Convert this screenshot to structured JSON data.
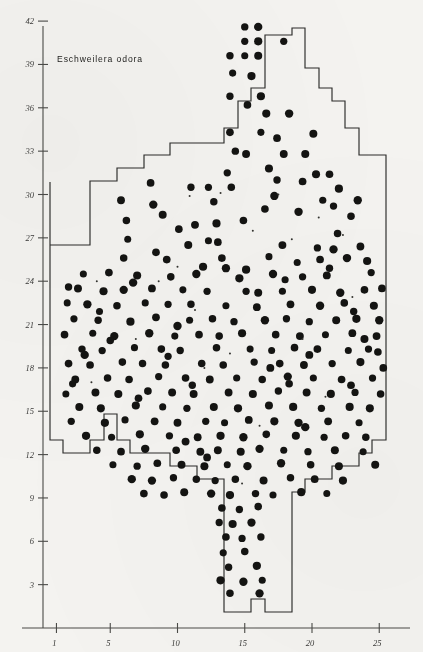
{
  "figure": {
    "title": "Eschweilera odora",
    "background_color": "#f4f3f0",
    "ink_color": "#141412",
    "axis_color": "#4a4a47"
  },
  "chart_data": {
    "type": "scatter",
    "title": "Eschweilera odora",
    "xlabel": "",
    "ylabel": "",
    "xlim": [
      0,
      26.5
    ],
    "ylim": [
      0,
      43
    ],
    "grid": false,
    "legend": null,
    "x_ticks": [
      1,
      5,
      10,
      15,
      20,
      25
    ],
    "x_tick_labels": [
      "1",
      "5",
      "10",
      "15",
      "20",
      "25"
    ],
    "y_ticks": [
      3,
      6,
      9,
      12,
      15,
      18,
      21,
      24,
      27,
      30,
      33,
      36,
      39,
      42
    ],
    "y_tick_labels": [
      "3",
      "6",
      "9",
      "12",
      "15",
      "18",
      "21",
      "24",
      "27",
      "30",
      "33",
      "36",
      "39",
      "42"
    ],
    "marker": "filled-circle",
    "marker_color": "#141412",
    "boundary_note": "irregular stepped plot outline",
    "point_count": 312,
    "points": [
      [
        15.0,
        41.6
      ],
      [
        16.0,
        41.6
      ],
      [
        15.0,
        40.6
      ],
      [
        16.0,
        40.6
      ],
      [
        17.9,
        40.6
      ],
      [
        13.9,
        39.6
      ],
      [
        15.0,
        39.6
      ],
      [
        16.0,
        39.6
      ],
      [
        15.5,
        38.2
      ],
      [
        13.9,
        36.8
      ],
      [
        16.2,
        36.8
      ],
      [
        16.6,
        35.6
      ],
      [
        18.3,
        35.6
      ],
      [
        13.9,
        34.3
      ],
      [
        16.2,
        34.3
      ],
      [
        15.1,
        32.8
      ],
      [
        17.9,
        32.8
      ],
      [
        19.5,
        32.8
      ],
      [
        13.7,
        31.5
      ],
      [
        17.4,
        31.0
      ],
      [
        20.3,
        31.4
      ],
      [
        21.3,
        31.4
      ],
      [
        8.0,
        30.8
      ],
      [
        11.0,
        30.5
      ],
      [
        12.3,
        30.5
      ],
      [
        14.0,
        30.5
      ],
      [
        19.3,
        30.9
      ],
      [
        22.0,
        30.4
      ],
      [
        5.8,
        29.6
      ],
      [
        8.2,
        29.3
      ],
      [
        21.6,
        29.2
      ],
      [
        23.4,
        29.6
      ],
      [
        6.2,
        28.2
      ],
      [
        11.3,
        27.9
      ],
      [
        14.9,
        28.2
      ],
      [
        22.9,
        28.5
      ],
      [
        6.3,
        26.9
      ],
      [
        10.8,
        26.5
      ],
      [
        13.0,
        26.7
      ],
      [
        17.8,
        26.5
      ],
      [
        20.4,
        26.3
      ],
      [
        21.6,
        26.2
      ],
      [
        23.6,
        26.4
      ],
      [
        9.2,
        25.5
      ],
      [
        13.3,
        25.6
      ],
      [
        16.8,
        25.7
      ],
      [
        18.9,
        25.3
      ],
      [
        20.6,
        25.5
      ],
      [
        22.6,
        25.6
      ],
      [
        24.1,
        25.4
      ],
      [
        3.0,
        24.5
      ],
      [
        4.9,
        24.6
      ],
      [
        7.0,
        24.4
      ],
      [
        9.5,
        24.3
      ],
      [
        11.4,
        24.5
      ],
      [
        14.6,
        24.2
      ],
      [
        17.1,
        24.5
      ],
      [
        19.3,
        24.3
      ],
      [
        21.1,
        24.4
      ],
      [
        24.4,
        24.6
      ],
      [
        1.9,
        23.6
      ],
      [
        2.6,
        23.5
      ],
      [
        4.5,
        23.3
      ],
      [
        6.0,
        23.4
      ],
      [
        8.1,
        23.5
      ],
      [
        10.4,
        23.4
      ],
      [
        12.2,
        23.3
      ],
      [
        15.1,
        23.3
      ],
      [
        16.0,
        23.2
      ],
      [
        17.8,
        23.3
      ],
      [
        20.0,
        23.4
      ],
      [
        22.1,
        23.2
      ],
      [
        23.9,
        23.4
      ],
      [
        25.2,
        23.5
      ],
      [
        1.8,
        22.5
      ],
      [
        3.3,
        22.4
      ],
      [
        5.5,
        22.3
      ],
      [
        7.6,
        22.5
      ],
      [
        9.3,
        22.4
      ],
      [
        11.0,
        22.4
      ],
      [
        13.6,
        22.3
      ],
      [
        15.9,
        22.2
      ],
      [
        18.4,
        22.4
      ],
      [
        20.6,
        22.3
      ],
      [
        22.4,
        22.5
      ],
      [
        24.6,
        22.3
      ],
      [
        2.3,
        21.4
      ],
      [
        4.1,
        21.3
      ],
      [
        6.5,
        21.2
      ],
      [
        8.4,
        21.5
      ],
      [
        10.9,
        21.3
      ],
      [
        12.6,
        21.4
      ],
      [
        14.2,
        21.2
      ],
      [
        16.5,
        21.3
      ],
      [
        18.1,
        21.4
      ],
      [
        19.8,
        21.2
      ],
      [
        21.8,
        21.3
      ],
      [
        23.3,
        21.4
      ],
      [
        25.0,
        21.3
      ],
      [
        1.6,
        20.3
      ],
      [
        3.7,
        20.4
      ],
      [
        5.3,
        20.2
      ],
      [
        7.9,
        20.4
      ],
      [
        9.8,
        20.2
      ],
      [
        11.6,
        20.3
      ],
      [
        13.1,
        20.2
      ],
      [
        14.8,
        20.4
      ],
      [
        17.3,
        20.3
      ],
      [
        19.1,
        20.2
      ],
      [
        21.0,
        20.3
      ],
      [
        23.0,
        20.4
      ],
      [
        24.8,
        20.2
      ],
      [
        2.9,
        19.3
      ],
      [
        4.4,
        19.2
      ],
      [
        6.8,
        19.4
      ],
      [
        8.8,
        19.3
      ],
      [
        10.2,
        19.2
      ],
      [
        12.9,
        19.4
      ],
      [
        15.4,
        19.3
      ],
      [
        17.0,
        19.2
      ],
      [
        18.7,
        19.4
      ],
      [
        20.4,
        19.3
      ],
      [
        22.7,
        19.2
      ],
      [
        24.2,
        19.3
      ],
      [
        1.9,
        18.3
      ],
      [
        3.5,
        18.2
      ],
      [
        5.9,
        18.4
      ],
      [
        7.4,
        18.3
      ],
      [
        9.1,
        18.2
      ],
      [
        11.8,
        18.3
      ],
      [
        13.4,
        18.2
      ],
      [
        15.7,
        18.4
      ],
      [
        17.6,
        18.3
      ],
      [
        19.4,
        18.2
      ],
      [
        21.5,
        18.3
      ],
      [
        23.6,
        18.4
      ],
      [
        2.4,
        17.2
      ],
      [
        4.8,
        17.3
      ],
      [
        6.4,
        17.2
      ],
      [
        8.6,
        17.4
      ],
      [
        10.6,
        17.3
      ],
      [
        12.4,
        17.2
      ],
      [
        14.4,
        17.3
      ],
      [
        16.3,
        17.2
      ],
      [
        18.2,
        17.4
      ],
      [
        20.1,
        17.3
      ],
      [
        22.2,
        17.2
      ],
      [
        24.5,
        17.3
      ],
      [
        1.7,
        16.2
      ],
      [
        3.9,
        16.3
      ],
      [
        5.6,
        16.2
      ],
      [
        7.8,
        16.4
      ],
      [
        9.6,
        16.3
      ],
      [
        11.2,
        16.2
      ],
      [
        13.8,
        16.3
      ],
      [
        15.6,
        16.2
      ],
      [
        17.5,
        16.4
      ],
      [
        19.6,
        16.3
      ],
      [
        21.4,
        16.2
      ],
      [
        23.2,
        16.3
      ],
      [
        25.1,
        16.2
      ],
      [
        2.7,
        15.3
      ],
      [
        4.3,
        15.2
      ],
      [
        6.9,
        15.4
      ],
      [
        8.9,
        15.3
      ],
      [
        10.7,
        15.2
      ],
      [
        12.7,
        15.3
      ],
      [
        14.5,
        15.2
      ],
      [
        16.8,
        15.4
      ],
      [
        18.6,
        15.3
      ],
      [
        20.7,
        15.2
      ],
      [
        22.8,
        15.3
      ],
      [
        24.3,
        15.2
      ],
      [
        2.1,
        14.3
      ],
      [
        4.6,
        14.2
      ],
      [
        6.1,
        14.4
      ],
      [
        8.3,
        14.3
      ],
      [
        10.0,
        14.2
      ],
      [
        12.1,
        14.3
      ],
      [
        13.5,
        14.2
      ],
      [
        15.3,
        14.4
      ],
      [
        17.2,
        14.3
      ],
      [
        19.0,
        14.2
      ],
      [
        21.2,
        14.3
      ],
      [
        23.5,
        14.2
      ],
      [
        3.2,
        13.3
      ],
      [
        5.1,
        13.2
      ],
      [
        7.2,
        13.4
      ],
      [
        9.4,
        13.3
      ],
      [
        11.5,
        13.2
      ],
      [
        13.2,
        13.3
      ],
      [
        14.9,
        13.2
      ],
      [
        16.6,
        13.4
      ],
      [
        18.8,
        13.3
      ],
      [
        20.9,
        13.2
      ],
      [
        22.5,
        13.3
      ],
      [
        24.0,
        13.2
      ],
      [
        4.0,
        12.3
      ],
      [
        5.8,
        12.2
      ],
      [
        7.6,
        12.4
      ],
      [
        9.9,
        12.3
      ],
      [
        11.7,
        12.2
      ],
      [
        13.0,
        12.3
      ],
      [
        14.7,
        12.2
      ],
      [
        16.1,
        12.4
      ],
      [
        17.9,
        12.3
      ],
      [
        19.7,
        12.2
      ],
      [
        21.7,
        12.3
      ],
      [
        23.8,
        12.2
      ],
      [
        5.2,
        11.3
      ],
      [
        7.0,
        11.2
      ],
      [
        8.5,
        11.4
      ],
      [
        10.3,
        11.3
      ],
      [
        12.0,
        11.2
      ],
      [
        13.7,
        11.3
      ],
      [
        15.2,
        11.2
      ],
      [
        17.7,
        11.4
      ],
      [
        19.9,
        11.3
      ],
      [
        22.0,
        11.2
      ],
      [
        24.7,
        11.3
      ],
      [
        6.6,
        10.3
      ],
      [
        8.1,
        10.2
      ],
      [
        9.7,
        10.4
      ],
      [
        11.4,
        10.3
      ],
      [
        12.8,
        10.2
      ],
      [
        14.3,
        10.3
      ],
      [
        16.4,
        10.2
      ],
      [
        18.4,
        10.4
      ],
      [
        20.2,
        10.3
      ],
      [
        22.3,
        10.2
      ],
      [
        7.5,
        9.3
      ],
      [
        9.0,
        9.2
      ],
      [
        10.5,
        9.4
      ],
      [
        12.5,
        9.3
      ],
      [
        13.9,
        9.2
      ],
      [
        15.8,
        9.3
      ],
      [
        17.1,
        9.2
      ],
      [
        19.2,
        9.4
      ],
      [
        21.1,
        9.3
      ],
      [
        13.3,
        8.3
      ],
      [
        14.6,
        8.2
      ],
      [
        16.0,
        8.4
      ],
      [
        13.1,
        7.3
      ],
      [
        14.1,
        7.2
      ],
      [
        15.5,
        7.3
      ],
      [
        13.6,
        6.3
      ],
      [
        14.8,
        6.2
      ],
      [
        16.2,
        6.3
      ],
      [
        13.4,
        5.2
      ],
      [
        15.0,
        5.3
      ],
      [
        13.8,
        4.2
      ],
      [
        15.9,
        4.3
      ],
      [
        13.2,
        3.3
      ],
      [
        14.9,
        3.2
      ],
      [
        16.3,
        3.3
      ],
      [
        13.9,
        2.4
      ],
      [
        16.1,
        2.4
      ],
      [
        12.9,
        28.0
      ],
      [
        11.9,
        25.0
      ],
      [
        10.1,
        27.6
      ],
      [
        19.0,
        28.8
      ],
      [
        17.2,
        29.9
      ],
      [
        21.9,
        27.3
      ],
      [
        8.9,
        28.6
      ],
      [
        23.1,
        21.9
      ],
      [
        2.2,
        16.9
      ],
      [
        5.0,
        19.9
      ],
      [
        18.0,
        24.1
      ],
      [
        20.8,
        29.6
      ],
      [
        6.7,
        23.9
      ],
      [
        12.3,
        26.8
      ],
      [
        9.3,
        18.8
      ],
      [
        3.1,
        18.9
      ],
      [
        16.9,
        18.0
      ],
      [
        24.9,
        19.1
      ],
      [
        22.9,
        16.8
      ],
      [
        19.5,
        13.9
      ],
      [
        11.1,
        16.8
      ],
      [
        7.1,
        15.9
      ],
      [
        15.1,
        24.8
      ],
      [
        10.6,
        12.9
      ],
      [
        13.6,
        24.9
      ],
      [
        18.3,
        16.9
      ],
      [
        21.3,
        24.9
      ],
      [
        4.2,
        21.9
      ],
      [
        8.4,
        26.0
      ],
      [
        12.7,
        29.5
      ],
      [
        17.4,
        33.9
      ],
      [
        16.8,
        31.8
      ],
      [
        14.3,
        33.0
      ],
      [
        20.1,
        34.2
      ],
      [
        15.2,
        36.2
      ],
      [
        14.1,
        38.4
      ],
      [
        6.0,
        25.6
      ],
      [
        10.0,
        20.9
      ],
      [
        23.9,
        20.0
      ],
      [
        25.3,
        18.0
      ],
      [
        12.2,
        11.8
      ],
      [
        16.5,
        29.0
      ],
      [
        19.8,
        18.9
      ]
    ],
    "small_points": [
      [
        4.0,
        24.0
      ],
      [
        10.9,
        29.9
      ],
      [
        13.2,
        30.1
      ],
      [
        17.5,
        30.0
      ],
      [
        3.6,
        17.0
      ],
      [
        11.3,
        22.0
      ],
      [
        20.5,
        28.4
      ],
      [
        22.3,
        27.2
      ],
      [
        15.6,
        27.5
      ],
      [
        8.6,
        24.0
      ],
      [
        18.5,
        26.9
      ],
      [
        14.8,
        10.0
      ],
      [
        12.0,
        18.0
      ],
      [
        6.9,
        20.0
      ],
      [
        21.0,
        16.0
      ],
      [
        23.0,
        22.9
      ],
      [
        16.1,
        14.0
      ],
      [
        10.0,
        25.0
      ],
      [
        13.9,
        19.0
      ],
      [
        19.3,
        20.0
      ]
    ]
  }
}
